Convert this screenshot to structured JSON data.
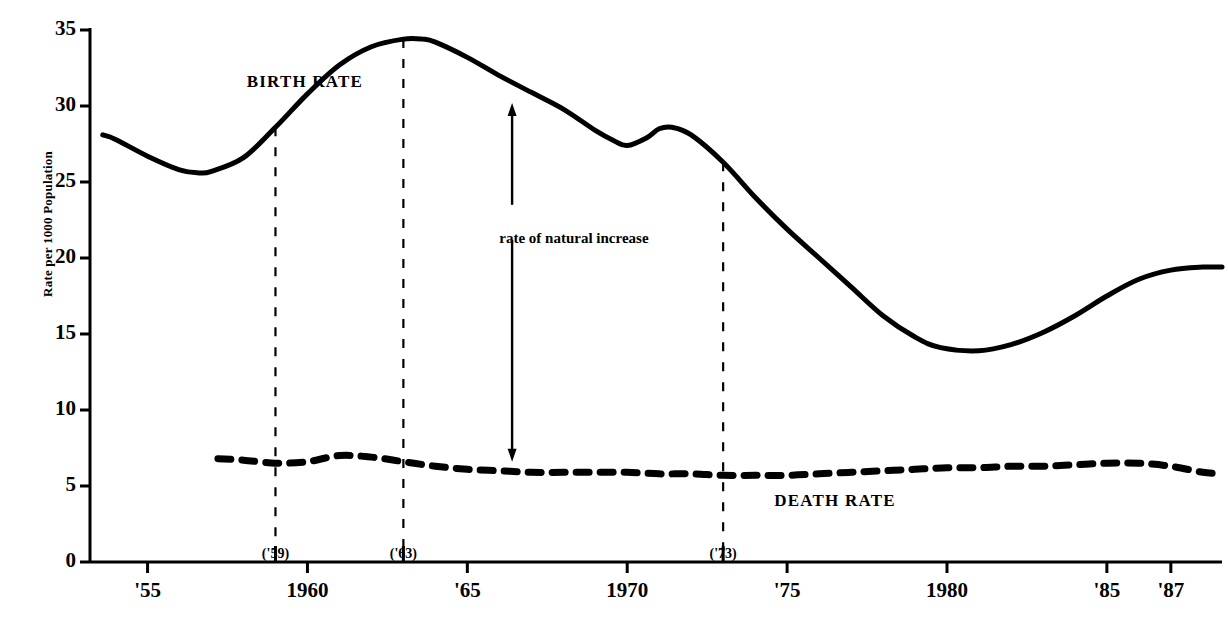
{
  "chart_data": {
    "type": "line",
    "title": "",
    "subtitle": "",
    "xlabel": "",
    "ylabel": "Rate per 1000 Population",
    "ylim": [
      0,
      35
    ],
    "yticks": [
      0,
      5,
      10,
      15,
      20,
      25,
      30,
      35
    ],
    "xlim": [
      1953.2,
      1988.6
    ],
    "grid": false,
    "legend_position": "inline-annotations",
    "xtick_labels": [
      "'55",
      "1960",
      "'65",
      "1970",
      "'75",
      "1980",
      "'85",
      "'87"
    ],
    "xtick_values": [
      1955,
      1960,
      1965,
      1970,
      1975,
      1980,
      1985,
      1987
    ],
    "xsub_labels": [
      "('59)",
      "('63)",
      "('73)"
    ],
    "xsub_values": [
      1959,
      1963,
      1973
    ],
    "annotations": [
      {
        "text": "BIRTH RATE",
        "x": 1958.1,
        "y": 31.6
      },
      {
        "text": "DEATH RATE",
        "x": 1974.6,
        "y": 4.0
      },
      {
        "text": "rate of natural increase",
        "x": 1966.0,
        "y": 21.2
      }
    ],
    "vertical_markers": [
      1959,
      1963,
      1973
    ],
    "arrow": {
      "label": "rate of natural increase",
      "x": 1966.4,
      "upper_from": 23.5,
      "upper_to": 30.2,
      "lower_from": 21.2,
      "lower_to": 6.6
    },
    "series": [
      {
        "name": "BIRTH RATE",
        "style": "solid",
        "x": [
          1953.6,
          1954,
          1955,
          1956,
          1956.6,
          1957,
          1958,
          1959,
          1960,
          1961,
          1962,
          1963,
          1963.6,
          1964,
          1965,
          1966,
          1967,
          1968,
          1969,
          1969.6,
          1970,
          1970.6,
          1971,
          1971.4,
          1972,
          1973,
          1974,
          1975,
          1976,
          1977,
          1978,
          1979,
          1979.8,
          1981,
          1982,
          1983,
          1984,
          1985,
          1986,
          1987,
          1988,
          1988.6
        ],
        "y": [
          28.1,
          27.8,
          26.7,
          25.8,
          25.6,
          25.7,
          26.6,
          28.6,
          30.8,
          32.7,
          33.9,
          34.4,
          34.4,
          34.2,
          33.2,
          32.0,
          30.9,
          29.8,
          28.4,
          27.7,
          27.4,
          27.9,
          28.5,
          28.6,
          28.1,
          26.3,
          24.0,
          21.9,
          20.0,
          18.1,
          16.2,
          14.8,
          14.1,
          13.9,
          14.3,
          15.1,
          16.2,
          17.5,
          18.6,
          19.2,
          19.4,
          19.4
        ]
      },
      {
        "name": "DEATH RATE",
        "style": "dashed",
        "x": [
          1957.2,
          1958,
          1959,
          1960,
          1961,
          1962,
          1963,
          1964,
          1965,
          1966,
          1967,
          1968,
          1969,
          1970,
          1971,
          1972,
          1973,
          1974,
          1975,
          1976,
          1977,
          1978,
          1979,
          1980,
          1981,
          1982,
          1983,
          1984,
          1985,
          1986,
          1987,
          1988,
          1988.6
        ],
        "y": [
          6.8,
          6.7,
          6.5,
          6.6,
          7.0,
          6.9,
          6.6,
          6.3,
          6.1,
          6.0,
          5.9,
          5.9,
          5.9,
          5.9,
          5.8,
          5.8,
          5.7,
          5.7,
          5.7,
          5.8,
          5.9,
          6.0,
          6.1,
          6.2,
          6.2,
          6.3,
          6.3,
          6.4,
          6.5,
          6.5,
          6.3,
          5.9,
          5.8
        ]
      }
    ]
  },
  "axis": {
    "origin_label": "0"
  },
  "colors": {
    "line": "#000000",
    "background": "#ffffff",
    "dashed_marker": "#000000"
  }
}
